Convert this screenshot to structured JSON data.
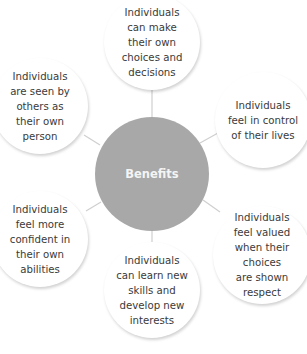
{
  "diagram": {
    "center": {
      "label": "Benefits",
      "color": "#a8a8a8"
    },
    "nodes": [
      {
        "id": "top",
        "label": "Individuals\ncan make\ntheir own\nchoices and\ndecisions"
      },
      {
        "id": "upper-right",
        "label": "Individuals\nfeel in control\nof their lives"
      },
      {
        "id": "lower-right",
        "label": "Individuals\nfeel valued\nwhen their choices\nare shown\nrespect"
      },
      {
        "id": "bottom",
        "label": "Individuals\ncan learn new\nskills and\ndevelop new\ninterests"
      },
      {
        "id": "lower-left",
        "label": "Individuals\nfeel more\nconfident in\ntheir own\nabilities"
      },
      {
        "id": "upper-left",
        "label": "Individuals\nare seen by\nothers as\ntheir own\nperson"
      }
    ],
    "connector_color": "#cfcfcf"
  }
}
